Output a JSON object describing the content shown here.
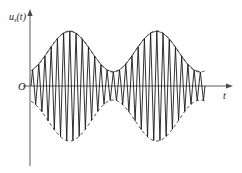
{
  "figure": {
    "title_visible": false,
    "background_color": "#ffffff",
    "axis_color": "#5a5a5a",
    "signal_color": "#1a1a1a",
    "envelope_color": "#2b2b2b",
    "y_axis_label": "u",
    "y_axis_label_subscript": "s",
    "y_axis_label_arg": "(t)",
    "x_axis_label": "t",
    "origin_label": "O"
  },
  "chart_data": {
    "type": "line",
    "title": "",
    "subtitle": "",
    "xlabel": "t",
    "ylabel": "u_s(t)",
    "grid": false,
    "legend": null,
    "legend_position": "none",
    "xlim": [
      0,
      1
    ],
    "ylim": [
      -1.15,
      1.15
    ],
    "xticks": [],
    "yticks": [],
    "xticklabels": [],
    "yticklabels": [],
    "annotations": [
      {
        "text": "O",
        "x": 0.0,
        "y": 0.0,
        "role": "origin-marker"
      },
      {
        "text": "t",
        "x": 1.0,
        "y": 0.0,
        "role": "x-axis-label"
      },
      {
        "text": "u_s(t)",
        "x": 0.0,
        "y": 1.15,
        "role": "y-axis-label"
      }
    ],
    "series": [
      {
        "name": "AM carrier",
        "style": "solid",
        "formula": "u_s(t) = (1 + m*cos(2*pi*f_m*t + phi_m)) * cos(2*pi*f_c*t)",
        "carrier_cycles": 28,
        "modulation_cycles": 2,
        "modulation_index": 0.72,
        "envelope_phase_deg": 200
      },
      {
        "name": "Upper envelope",
        "style": "dashed",
        "formula": "A(t) = 1 + m*cos(2*pi*f_m*t + phi_m)"
      },
      {
        "name": "Lower envelope",
        "style": "dashed",
        "formula": "-A(t) = -(1 + m*cos(2*pi*f_m*t + phi_m))"
      },
      {
        "name": "Peak chords",
        "style": "solid-thin",
        "formula": "straight segments joining successive upper carrier peaks"
      }
    ],
    "geometry": {
      "y_axis_x_px": 30,
      "baseline_y_px": 86,
      "signal_start_x_px": 31,
      "signal_end_x_px": 205,
      "x_axis_end_px": 232,
      "y_axis_top_px": 12,
      "y_axis_bottom_px": 166,
      "envelope_peak1_x_px": 75,
      "envelope_trough_x_px": 128,
      "envelope_peak2_x_px": 180,
      "envelope_max_amp_px": 55,
      "envelope_min_amp_px": 14
    }
  }
}
